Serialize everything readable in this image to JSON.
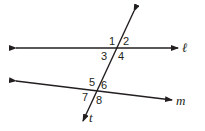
{
  "diagram": {
    "lines": [
      {
        "name": "l",
        "label": "ℓ"
      },
      {
        "name": "m",
        "label": "m"
      },
      {
        "name": "t",
        "label": "t"
      }
    ],
    "angles": [
      "1",
      "2",
      "3",
      "4",
      "5",
      "6",
      "7",
      "8"
    ],
    "colors": {
      "stroke": "#231f20",
      "background": "#ffffff"
    }
  }
}
